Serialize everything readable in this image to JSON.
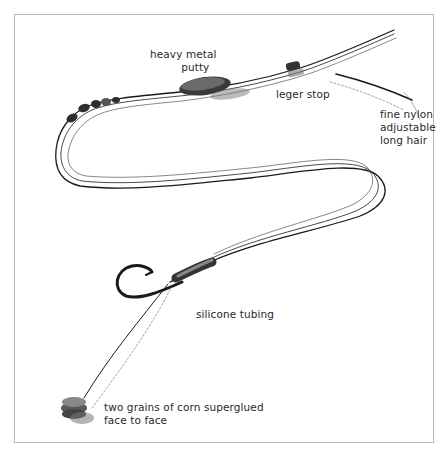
{
  "diagram": {
    "labels": {
      "putty": {
        "lines": [
          "heavy metal",
          "putty"
        ]
      },
      "leger_stop": {
        "lines": [
          "leger stop"
        ]
      },
      "hair": {
        "lines": [
          "fine nylon",
          "adjustable",
          "long hair"
        ]
      },
      "tubing": {
        "lines": [
          "silicone tubing"
        ]
      },
      "bait": {
        "lines": [
          "two grains of corn superglued",
          "face to face"
        ]
      }
    },
    "colors": {
      "ink": "#1a1a1a",
      "frame": "#b8b8b8",
      "text": "#2a2a2a",
      "background": "#ffffff"
    }
  }
}
